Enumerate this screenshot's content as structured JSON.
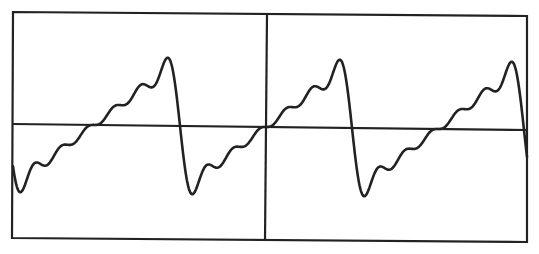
{
  "figure": {
    "colors": {
      "background": "#ffffff",
      "line": "#222222"
    },
    "frame": {
      "top_left": [
        13,
        12
      ],
      "top_right": [
        527,
        16
      ],
      "bottom_right": [
        527,
        242
      ],
      "bottom_left": [
        12,
        238
      ]
    },
    "horizontal_axis": {
      "left": [
        13,
        124
      ],
      "right": [
        527,
        130
      ]
    },
    "vertical_axis": {
      "top": [
        267,
        14
      ],
      "bottom": [
        265,
        240
      ]
    },
    "waveform": {
      "type": "sawtooth_fourier_partial_sum",
      "harmonics": 6,
      "center_x": 266,
      "half_period_px": 86,
      "amplitude_px_per_unit": 21,
      "x_start": 13,
      "x_end": 527,
      "features": {
        "peaks": [
          [
            168,
            54
          ],
          [
            339,
            57
          ],
          [
            513,
            58
          ]
        ],
        "troughs": [
          [
            27,
            195
          ],
          [
            195,
            197
          ],
          [
            367,
            199
          ]
        ],
        "axis_crossings_up": [
          97,
          266,
          440
        ],
        "axis_crossings_down": [
          13,
          181,
          352,
          527
        ]
      }
    }
  }
}
